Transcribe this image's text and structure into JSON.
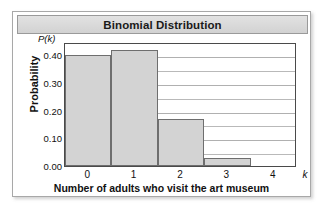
{
  "figure": {
    "title": "Binomial Distribution"
  },
  "chart_data": {
    "type": "bar",
    "title": "Binomial Distribution",
    "xlabel": "Number of adults who visit the art museum",
    "ylabel": "Probability",
    "x_axis_symbol": "k",
    "y_axis_symbol": "P(k)",
    "categories": [
      "0",
      "1",
      "2",
      "3",
      "4"
    ],
    "values": [
      0.4,
      0.42,
      0.17,
      0.03,
      0.0
    ],
    "xlim": [
      -0.5,
      4.5
    ],
    "ylim": [
      0.0,
      0.4475
    ],
    "ytick_labels": [
      "0.00",
      "0.10",
      "0.20",
      "0.30",
      "0.40"
    ],
    "ytick_values": [
      0.0,
      0.1,
      0.2,
      0.3,
      0.4
    ],
    "xtick_labels": [
      "0",
      "1",
      "2",
      "3",
      "4"
    ],
    "minor_gridline_step": 0.05,
    "grid": true,
    "legend": false,
    "bar_fill_color": "#d3d3d3",
    "bar_edge_color": "#6e6e6e",
    "gridline_color": "#b9b9b9",
    "frame_color": "#4a4a4a"
  }
}
